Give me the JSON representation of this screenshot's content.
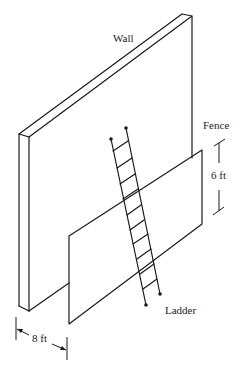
{
  "diagram": {
    "labels": {
      "wall": "Wall",
      "fence": "Fence",
      "ladder": "Ladder",
      "fence_height": "6 ft",
      "distance": "8 ft"
    },
    "colors": {
      "stroke": "#1a1a1a",
      "background": "#ffffff",
      "text": "#222222"
    },
    "dimensions": {
      "fence_height_ft": 6,
      "fence_to_wall_ft": 8
    }
  }
}
